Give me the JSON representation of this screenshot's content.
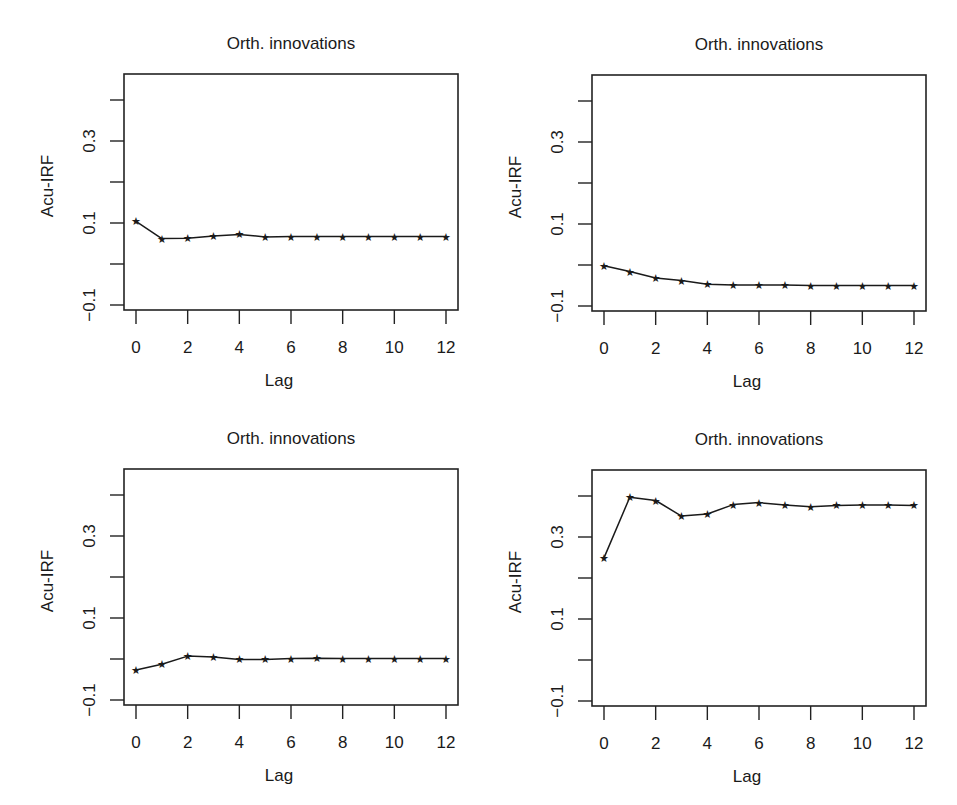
{
  "figure": {
    "layout": "2x2 grid",
    "line_color": "#1a1a1a",
    "background": "#ffffff"
  },
  "chart_data": [
    {
      "type": "line",
      "position": "top-left",
      "title": "Orth. innovations",
      "xlabel": "Lag",
      "ylabel": "Acu-IRF",
      "x": [
        0,
        1,
        2,
        3,
        4,
        5,
        6,
        7,
        8,
        9,
        10,
        11,
        12
      ],
      "values": [
        0.104,
        0.062,
        0.063,
        0.068,
        0.072,
        0.066,
        0.067,
        0.067,
        0.067,
        0.067,
        0.067,
        0.067,
        0.067
      ],
      "xticks": [
        "0",
        "2",
        "4",
        "6",
        "8",
        "10",
        "12"
      ],
      "yticks": [
        -0.1,
        0.0,
        0.1,
        0.2,
        0.3,
        0.4
      ],
      "ytick_labels": [
        "-0.1",
        "",
        "0.1",
        "",
        "0.3",
        ""
      ],
      "xlim": [
        -0.5,
        12.5
      ],
      "ylim": [
        -0.12,
        0.47
      ],
      "marker": "star",
      "grid": false
    },
    {
      "type": "line",
      "position": "top-right",
      "title": "Orth. innovations",
      "xlabel": "Lag",
      "ylabel": "Acu-IRF",
      "x": [
        0,
        1,
        2,
        3,
        4,
        5,
        6,
        7,
        8,
        9,
        10,
        11,
        12
      ],
      "values": [
        -0.002,
        -0.016,
        -0.032,
        -0.038,
        -0.047,
        -0.049,
        -0.049,
        -0.049,
        -0.05,
        -0.05,
        -0.05,
        -0.05,
        -0.05
      ],
      "xticks": [
        "0",
        "2",
        "4",
        "6",
        "8",
        "10",
        "12"
      ],
      "yticks": [
        -0.1,
        0.0,
        0.1,
        0.2,
        0.3,
        0.4
      ],
      "ytick_labels": [
        "-0.1",
        "",
        "0.1",
        "",
        "0.3",
        ""
      ],
      "xlim": [
        -0.5,
        12.5
      ],
      "ylim": [
        -0.12,
        0.47
      ],
      "marker": "star",
      "grid": false
    },
    {
      "type": "line",
      "position": "bottom-left",
      "title": "Orth. innovations",
      "xlabel": "Lag",
      "ylabel": "Acu-IRF",
      "x": [
        0,
        1,
        2,
        3,
        4,
        5,
        6,
        7,
        8,
        9,
        10,
        11,
        12
      ],
      "values": [
        -0.027,
        -0.013,
        0.007,
        0.005,
        -0.001,
        -0.001,
        0.001,
        0.002,
        0.001,
        0.001,
        0.001,
        0.001,
        0.001
      ],
      "xticks": [
        "0",
        "2",
        "4",
        "6",
        "8",
        "10",
        "12"
      ],
      "yticks": [
        -0.1,
        0.0,
        0.1,
        0.2,
        0.3,
        0.4
      ],
      "ytick_labels": [
        "-0.1",
        "",
        "0.1",
        "",
        "0.3",
        ""
      ],
      "xlim": [
        -0.5,
        12.5
      ],
      "ylim": [
        -0.12,
        0.47
      ],
      "marker": "star",
      "grid": false
    },
    {
      "type": "line",
      "position": "bottom-right",
      "title": "Orth. innovations",
      "xlabel": "Lag",
      "ylabel": "Acu-IRF",
      "x": [
        0,
        1,
        2,
        3,
        4,
        5,
        6,
        7,
        8,
        9,
        10,
        11,
        12
      ],
      "values": [
        0.249,
        0.397,
        0.389,
        0.351,
        0.356,
        0.379,
        0.384,
        0.378,
        0.374,
        0.377,
        0.378,
        0.378,
        0.377
      ],
      "xticks": [
        "0",
        "2",
        "4",
        "6",
        "8",
        "10",
        "12"
      ],
      "yticks": [
        -0.1,
        0.0,
        0.1,
        0.2,
        0.3,
        0.4
      ],
      "ytick_labels": [
        "-0.1",
        "",
        "0.1",
        "",
        "0.3",
        ""
      ],
      "xlim": [
        -0.5,
        12.5
      ],
      "ylim": [
        -0.12,
        0.47
      ],
      "marker": "star",
      "grid": false
    }
  ]
}
